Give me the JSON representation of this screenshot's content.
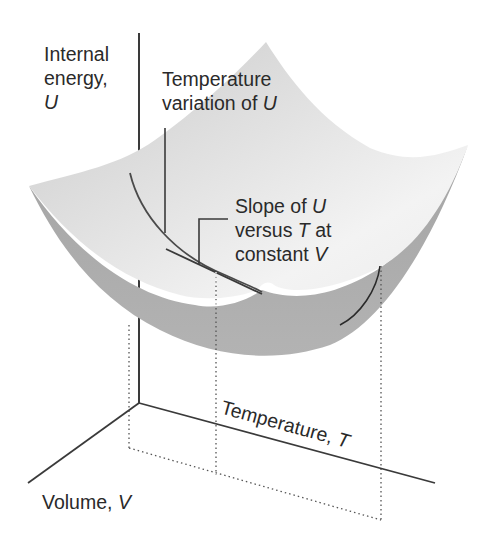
{
  "diagram": {
    "colors": {
      "background": "#ffffff",
      "surface_top_light": "#f4f4f4",
      "surface_top_mid": "#d9d9d9",
      "surface_underside": "#a9a9a9",
      "axis_line": "#3a3a3a",
      "text": "#2a2a2a",
      "dotted_line": "#555555"
    },
    "labels": {
      "u_axis": {
        "line1": "Internal",
        "line2": "energy,",
        "symbol": "U"
      },
      "temp_variation": {
        "line1": "Temperature",
        "line2_prefix": "variation of ",
        "symbol": "U"
      },
      "slope": {
        "line1_prefix": "Slope of ",
        "line1_symbol": "U",
        "line2_prefix": "versus ",
        "line2_symbol": "T",
        "line2_suffix": " at",
        "line3_prefix": "constant ",
        "line3_symbol": "V"
      },
      "t_axis": {
        "prefix": "Temperature, ",
        "symbol": "T"
      },
      "v_axis": {
        "prefix": "Volume, ",
        "symbol": "V"
      }
    },
    "axes": [
      {
        "name": "U",
        "label": "Internal energy, U",
        "direction": "vertical"
      },
      {
        "name": "T",
        "label": "Temperature, T",
        "direction": "right-down"
      },
      {
        "name": "V",
        "label": "Volume, V",
        "direction": "left-down"
      }
    ]
  }
}
